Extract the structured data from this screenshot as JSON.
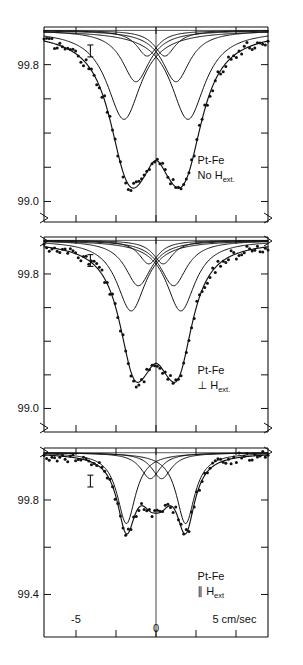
{
  "figure": {
    "title": "",
    "xaxis": {
      "label_left": "-5",
      "label_zero": "0",
      "label_right": "5 cm/sec",
      "unit": "cm/sec",
      "range": [
        -7.0,
        7.0
      ],
      "ticks": [
        -5,
        -2.5,
        0,
        2.5,
        5
      ]
    },
    "panels": [
      {
        "id": "panel-no-field",
        "sample": "Pt-Fe",
        "condition_prefix": "No",
        "condition_symbol": "",
        "condition_field": "H",
        "condition_sub": "ext.",
        "ylabels": [
          "99.8",
          "99.0"
        ],
        "ylabel_values": [
          99.8,
          99.0
        ],
        "ytick_values": [
          99.8,
          99.6,
          99.4,
          99.2,
          99.0
        ],
        "ylim": [
          98.88,
          100.02
        ],
        "error_bar": 0.07
      },
      {
        "id": "panel-perp-field",
        "sample": "Pt-Fe",
        "condition_prefix": "",
        "condition_symbol": "⊥",
        "condition_field": "H",
        "condition_sub": "ext.",
        "ylabels": [
          "99.8",
          "99.0"
        ],
        "ylabel_values": [
          99.8,
          99.0
        ],
        "ytick_values": [
          99.8,
          99.6,
          99.4,
          99.2,
          99.0
        ],
        "ylim": [
          98.86,
          100.02
        ],
        "error_bar": 0.07
      },
      {
        "id": "panel-para-field",
        "sample": "Pt-Fe",
        "condition_prefix": "",
        "condition_symbol": "∥",
        "condition_field": "H",
        "condition_sub": "ext",
        "ylabels": [
          "99.8",
          "99.4"
        ],
        "ylabel_values": [
          99.8,
          99.4
        ],
        "ytick_values": [
          99.8,
          99.6,
          99.4
        ],
        "ylim": [
          99.22,
          100.02
        ],
        "error_bar": 0.05
      }
    ]
  },
  "chart_data": {
    "type": "line",
    "xlabel": "velocity (cm/sec)",
    "ylabel": "relative transmission (%)",
    "xlim": [
      -7.0,
      7.0
    ],
    "grid": false,
    "legend": "none",
    "panels": [
      {
        "name": "No H_ext",
        "ylim": [
          98.88,
          100.02
        ],
        "ytick_labels": [
          "99.8",
          "99.0"
        ],
        "baseline": 100.0,
        "components": [
          {
            "name": "sub-line-1",
            "center": -0.55,
            "width": 1.6,
            "depth": 0.15
          },
          {
            "name": "sub-line-2",
            "center": 0.55,
            "width": 1.6,
            "depth": 0.15
          },
          {
            "name": "sub-line-3",
            "center": -1.25,
            "width": 2.1,
            "depth": 0.3
          },
          {
            "name": "sub-line-4",
            "center": 1.25,
            "width": 2.1,
            "depth": 0.3
          },
          {
            "name": "sub-line-5",
            "center": -2.0,
            "width": 2.6,
            "depth": 0.52
          },
          {
            "name": "sub-line-6",
            "center": 2.0,
            "width": 2.6,
            "depth": 0.52
          }
        ],
        "envelope": {
          "name": "total-fit",
          "minima": [
            -2.15,
            2.15
          ],
          "min_value": 98.94,
          "central_max": 99.06
        }
      },
      {
        "name": "perpendicular H_ext",
        "ylim": [
          98.86,
          100.02
        ],
        "ytick_labels": [
          "99.8",
          "99.0"
        ],
        "baseline": 100.0,
        "components": [
          {
            "name": "sub-line-1",
            "center": -0.45,
            "width": 1.5,
            "depth": 0.14
          },
          {
            "name": "sub-line-2",
            "center": 0.45,
            "width": 1.5,
            "depth": 0.14
          },
          {
            "name": "sub-line-3",
            "center": -1.1,
            "width": 2.0,
            "depth": 0.27
          },
          {
            "name": "sub-line-4",
            "center": 1.1,
            "width": 2.0,
            "depth": 0.27
          },
          {
            "name": "sub-line-5",
            "center": -1.55,
            "width": 2.2,
            "depth": 0.42
          },
          {
            "name": "sub-line-6",
            "center": 1.55,
            "width": 2.2,
            "depth": 0.42
          }
        ],
        "envelope": {
          "name": "total-fit",
          "minima": [
            -1.75,
            1.75
          ],
          "min_value": 98.93,
          "central_max": 99.12
        }
      },
      {
        "name": "parallel H_ext",
        "ylim": [
          99.22,
          100.02
        ],
        "ytick_labels": [
          "99.8",
          "99.4"
        ],
        "baseline": 100.0,
        "components": [
          {
            "name": "sub-line-1",
            "center": -0.35,
            "width": 1.5,
            "depth": 0.11
          },
          {
            "name": "sub-line-2",
            "center": 0.35,
            "width": 1.5,
            "depth": 0.11
          },
          {
            "name": "sub-line-3",
            "center": -1.85,
            "width": 1.4,
            "depth": 0.3
          },
          {
            "name": "sub-line-4",
            "center": 1.85,
            "width": 1.4,
            "depth": 0.3
          }
        ],
        "envelope": {
          "name": "total-fit",
          "minima": [
            -2.1,
            2.1
          ],
          "min_value": 99.35,
          "central_max": 99.47
        }
      }
    ]
  }
}
